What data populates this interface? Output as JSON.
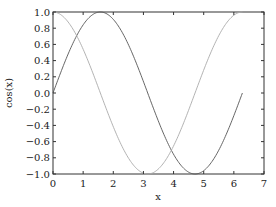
{
  "chart_data": {
    "type": "line",
    "title": "",
    "xlabel": "x",
    "ylabel": "cos(x)",
    "xlim": [
      0,
      7
    ],
    "ylim": [
      -1.0,
      1.0
    ],
    "grid": false,
    "legend": null,
    "xticks": [
      "0",
      "1",
      "2",
      "3",
      "4",
      "5",
      "6",
      "7"
    ],
    "yticks": [
      "1.0",
      "0.8",
      "0.6",
      "0.4",
      "0.2",
      "0.0",
      "−0.2",
      "−0.4",
      "−0.6",
      "−0.8",
      "−1.0"
    ],
    "x": [
      0,
      0.5,
      1.0,
      1.5,
      2.0,
      2.5,
      3.0,
      3.5,
      4.0,
      4.5,
      5.0,
      5.5,
      6.0,
      6.283
    ],
    "series": [
      {
        "name": "sin(x)",
        "color": "#555555",
        "values": [
          0.0,
          0.479,
          0.841,
          0.997,
          0.909,
          0.598,
          0.141,
          -0.351,
          -0.757,
          -0.978,
          -0.959,
          -0.706,
          -0.279,
          0.0
        ]
      },
      {
        "name": "cos(x)",
        "color": "#aaaaaa",
        "values": [
          1.0,
          0.878,
          0.54,
          0.071,
          -0.416,
          -0.801,
          -0.99,
          -0.936,
          -0.654,
          -0.211,
          0.284,
          0.709,
          0.96,
          1.0
        ]
      }
    ]
  },
  "plot": {
    "frame_color": "#333333"
  }
}
